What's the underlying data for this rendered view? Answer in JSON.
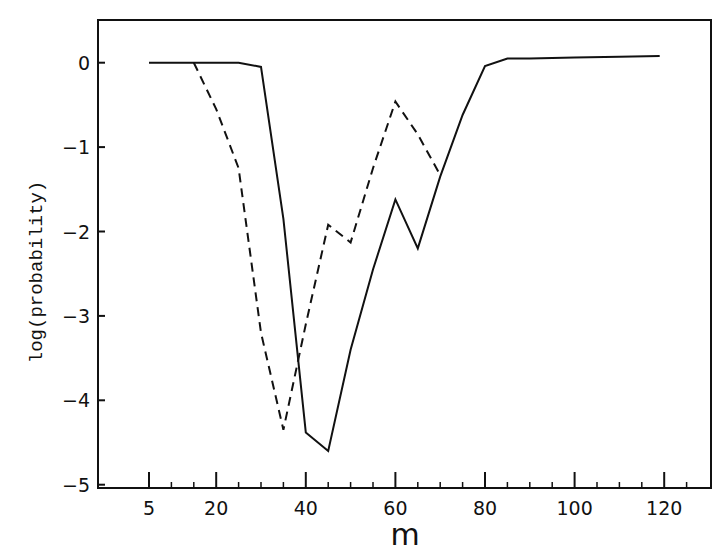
{
  "chart_data": {
    "type": "line",
    "title": "",
    "xlabel": "m",
    "ylabel": "log(probability)",
    "xlim": [
      -6,
      133
    ],
    "ylim": [
      -5.2,
      0.5
    ],
    "grid": false,
    "legend": null,
    "x_ticks": [
      5,
      20,
      40,
      60,
      80,
      100,
      120
    ],
    "x_tick_labels": [
      "5",
      "20",
      "40",
      "60",
      "80",
      "100",
      "120"
    ],
    "y_ticks": [
      0,
      -1,
      -2,
      -3,
      -4,
      -5
    ],
    "y_tick_labels": [
      "0",
      "−1",
      "−2",
      "−3",
      "−4",
      "−5"
    ],
    "series": [
      {
        "name": "solid",
        "style": "solid",
        "x": [
          5,
          10,
          15,
          20,
          25,
          30,
          35,
          40,
          45,
          50,
          55,
          60,
          65,
          70,
          75,
          80,
          85,
          90,
          100,
          110,
          119
        ],
        "y": [
          0,
          0,
          0,
          0,
          0,
          -0.05,
          -1.85,
          -4.38,
          -4.6,
          -3.4,
          -2.45,
          -1.62,
          -2.2,
          -1.35,
          -0.62,
          -0.04,
          0.05,
          0.05,
          0.06,
          0.07,
          0.08
        ]
      },
      {
        "name": "dashed",
        "style": "dashed",
        "x": [
          15,
          20,
          25,
          30,
          35,
          40,
          45,
          50,
          55,
          60,
          65,
          70
        ],
        "y": [
          0,
          -0.55,
          -1.25,
          -3.2,
          -4.35,
          -3.1,
          -1.92,
          -2.13,
          -1.25,
          -0.46,
          -0.85,
          -1.33
        ]
      }
    ]
  }
}
